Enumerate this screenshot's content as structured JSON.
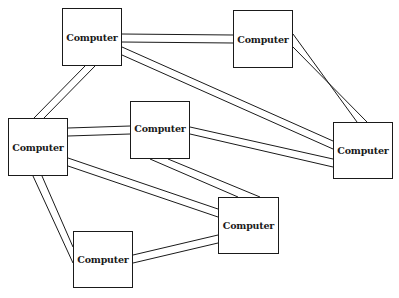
{
  "diagram": {
    "title": "",
    "nodes": [
      {
        "id": "A",
        "label": "Computer",
        "x": 62,
        "y": 8,
        "w": 60,
        "h": 58
      },
      {
        "id": "D",
        "label": "Computer",
        "x": 233,
        "y": 10,
        "w": 60,
        "h": 58
      },
      {
        "id": "B",
        "label": "Computer",
        "x": 130,
        "y": 101,
        "w": 60,
        "h": 58
      },
      {
        "id": "C",
        "label": "Computer",
        "x": 8,
        "y": 118,
        "w": 60,
        "h": 58
      },
      {
        "id": "E",
        "label": "Computer",
        "x": 333,
        "y": 122,
        "w": 60,
        "h": 57
      },
      {
        "id": "G",
        "label": "Computer",
        "x": 218,
        "y": 197,
        "w": 61,
        "h": 57
      },
      {
        "id": "F",
        "label": "Computer",
        "x": 73,
        "y": 231,
        "w": 60,
        "h": 57
      }
    ],
    "edges": [
      {
        "from": "A",
        "to": "D",
        "style": "double-line"
      },
      {
        "from": "A",
        "to": "E",
        "style": "double-line"
      },
      {
        "from": "A",
        "to": "C",
        "style": "double-line"
      },
      {
        "from": "D",
        "to": "E",
        "style": "double-line"
      },
      {
        "from": "C",
        "to": "B",
        "style": "double-line"
      },
      {
        "from": "B",
        "to": "E",
        "style": "double-line"
      },
      {
        "from": "B",
        "to": "G",
        "style": "double-line"
      },
      {
        "from": "C",
        "to": "G",
        "style": "double-line"
      },
      {
        "from": "C",
        "to": "F",
        "style": "double-line"
      },
      {
        "from": "F",
        "to": "G",
        "style": "double-line"
      }
    ]
  }
}
